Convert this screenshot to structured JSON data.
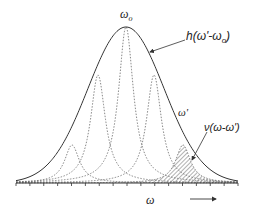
{
  "figure": {
    "colors": {
      "envelope": "#333333",
      "lorentzian": "#6a6a6a",
      "hatch": "#555555",
      "axis": "#333333",
      "text": "#222222"
    },
    "labels": {
      "center_frequency": "ω",
      "center_frequency_sub": "o",
      "envelope_function": "h(ω'-ω",
      "envelope_function_sub": "o",
      "envelope_function_close": ")",
      "component_frequency": "ω'",
      "component_function": "ν(ω-ω')",
      "axis_variable": "ω"
    },
    "icons": {
      "axis_direction": "right-arrow-icon"
    }
  },
  "chart_data": {
    "type": "line",
    "title": "",
    "xlabel": "ω",
    "ylabel": "",
    "envelope": {
      "name": "h(ω'-ω0)",
      "shape": "gaussian",
      "center_px": 126,
      "peak_y_px": 27,
      "sigma_px": 38
    },
    "components": [
      {
        "name": "lorentzian-1",
        "center_px": 72,
        "peak_y_px": 145,
        "style": "dashed"
      },
      {
        "name": "lorentzian-2",
        "center_px": 98,
        "peak_y_px": 75,
        "style": "dashed"
      },
      {
        "name": "lorentzian-3",
        "center_px": 126,
        "peak_y_px": 27,
        "style": "dashed"
      },
      {
        "name": "lorentzian-4",
        "center_px": 154,
        "peak_y_px": 75,
        "style": "dashed"
      },
      {
        "name": "lorentzian-5 ν(ω-ω')",
        "center_px": 183,
        "peak_y_px": 145,
        "style": "dashed",
        "hatched": true
      }
    ],
    "baseline_y_px": 183,
    "x_range_px": [
      16,
      238
    ],
    "ticks": 17,
    "grid": false,
    "legend": "none"
  }
}
